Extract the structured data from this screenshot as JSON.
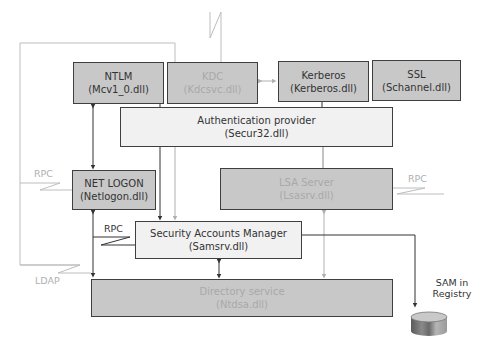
{
  "diagram": {
    "components": {
      "ntlm": {
        "name": "NTLM",
        "dll": "(Mcv1_0.dll)"
      },
      "kdc": {
        "name": "KDC",
        "dll": "(Kdcsvc.dll)"
      },
      "kerberos": {
        "name": "Kerberos",
        "dll": "(Kerberos.dll)"
      },
      "ssl": {
        "name": "SSL",
        "dll": "(Schannel.dll)"
      },
      "auth_provider": {
        "name": "Authentication provider",
        "dll": "(Secur32.dll)"
      },
      "netlogon": {
        "name": "NET LOGON",
        "dll": "(Netlogon.dll)"
      },
      "lsa_server": {
        "name": "LSA Server",
        "dll": "(Lsasrv.dll)"
      },
      "sam": {
        "name": "Security Accounts Manager",
        "dll": "(Samsrv.dll)"
      },
      "directory_service": {
        "name": "Directory service",
        "dll": "(Ntdsa.dll)"
      }
    },
    "labels": {
      "rpc_left": "RPC",
      "rpc_right": "RPC",
      "rpc_sam": "RPC",
      "ldap": "LDAP",
      "sam_registry_line1": "SAM in",
      "sam_registry_line2": "Registry"
    },
    "colors": {
      "dark_box": "#c8c8c8",
      "light_box": "#f1f1f1",
      "border": "#3f3f3f",
      "faded_line": "#b8b8b8",
      "faded_text": "#a8a8a8"
    }
  }
}
